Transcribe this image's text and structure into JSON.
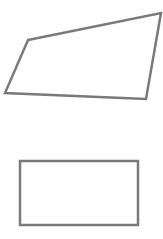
{
  "diagram": {
    "background": "#ffffff",
    "stroke_color": "#7a7a7a",
    "stroke_width": 2.5,
    "shapes": [
      {
        "id": "quadrilateral",
        "type": "polygon",
        "points": "28,40 161,13 146,99 5,93",
        "fill": "none"
      },
      {
        "id": "rectangle",
        "type": "rect",
        "x": 20,
        "y": 161,
        "width": 118,
        "height": 64,
        "fill": "none"
      }
    ]
  }
}
